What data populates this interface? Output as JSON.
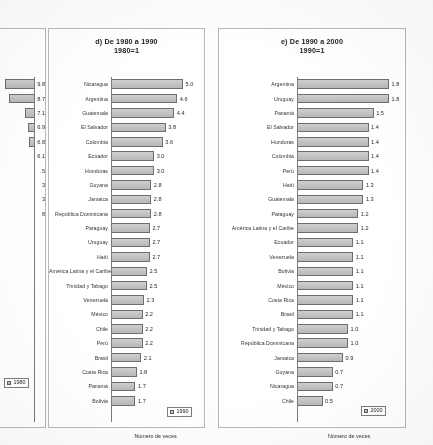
{
  "document": {
    "kind": "scanned-report-page",
    "axis_label": "Número de veces"
  },
  "panel_c": {
    "legend": "1980",
    "axis_fragment": "veces",
    "visible_values": [
      "9.8",
      "8.7",
      "7.1",
      "6.9",
      "6.8",
      "6.1",
      ".5",
      "3",
      "3",
      "8"
    ]
  },
  "panel_d": {
    "title": "d) De 1980 a 1990",
    "subtitle": "1980=1",
    "legend": "1990",
    "axis_label": "Número de veces"
  },
  "panel_e": {
    "title": "e) De 1990 a 2000",
    "subtitle": "1990=1",
    "legend": "2000",
    "axis_label": "Número de veces"
  },
  "chart_data": [
    {
      "id": "panel_d",
      "type": "bar",
      "orientation": "horizontal",
      "title": "d) De 1980 a 1990",
      "subtitle": "1980=1",
      "xlabel": "Número de veces",
      "ylabel": "",
      "xlim": [
        0,
        5.0
      ],
      "grid": false,
      "legend": "1990",
      "legend_position": "bottom-right",
      "categories": [
        "Nicaragua",
        "Argentina",
        "Guatemala",
        "El Salvador",
        "Colombia",
        "Ecuador",
        "Honduras",
        "Guyana",
        "Jamaica",
        "República Dominicana",
        "Paraguay",
        "Uruguay",
        "Haití",
        "América Latina y el Caribe",
        "Trinidad y Tabago",
        "Venezuela",
        "México",
        "Chile",
        "Perú",
        "Brasil",
        "Costa Rica",
        "Panamá",
        "Bolivia"
      ],
      "values": [
        5.0,
        4.6,
        4.4,
        3.8,
        3.6,
        3.0,
        3.0,
        2.8,
        2.8,
        2.8,
        2.7,
        2.7,
        2.7,
        2.5,
        2.5,
        2.3,
        2.2,
        2.2,
        2.2,
        2.1,
        1.8,
        1.7,
        1.7
      ],
      "value_labels": [
        "5.0",
        "4.6",
        "4.4",
        "3.8",
        "3.6",
        "3.0",
        "3.0",
        "2.8",
        "2.8",
        "2.8",
        "2.7",
        "2.7",
        "2.7",
        "2.5",
        "2.5",
        "2.3",
        "2.2",
        "2.2",
        "2.2",
        "2.1",
        "1.8",
        "1.7",
        "1.7"
      ]
    },
    {
      "id": "panel_e",
      "type": "bar",
      "orientation": "horizontal",
      "title": "e) De 1990 a 2000",
      "subtitle": "1990=1",
      "xlabel": "Número de veces",
      "ylabel": "",
      "xlim": [
        0,
        1.8
      ],
      "grid": false,
      "legend": "2000",
      "legend_position": "bottom-right",
      "categories": [
        "Argentina",
        "Uruguay",
        "Panamá",
        "El Salvador",
        "Honduras",
        "Colombia",
        "Perú",
        "Haití",
        "Guatemala",
        "Paraguay",
        "América Latina y el Caribe",
        "Ecuador",
        "Venezuela",
        "Bolivia",
        "México",
        "Costa Rica",
        "Brasil",
        "Trinidad y Tabago",
        "República Dominicana",
        "Jamaica",
        "Guyana",
        "Nicaragua",
        "Chile"
      ],
      "values": [
        1.8,
        1.8,
        1.5,
        1.4,
        1.4,
        1.4,
        1.4,
        1.3,
        1.3,
        1.2,
        1.2,
        1.1,
        1.1,
        1.1,
        1.1,
        1.1,
        1.1,
        1.0,
        1.0,
        0.9,
        0.7,
        0.7,
        0.5
      ],
      "value_labels": [
        "1.8",
        "1.8",
        "1.5",
        "1.4",
        "1.4",
        "1.4",
        "1.4",
        "1.3",
        "1.3",
        "1.2",
        "1.2",
        "1.1",
        "1.1",
        "1.1",
        "1.1",
        "1.1",
        "1.1",
        "1.0",
        "1.0",
        "0.9",
        "0.7",
        "0.7",
        "0.5"
      ]
    },
    {
      "id": "panel_c",
      "type": "bar",
      "orientation": "horizontal",
      "title": "",
      "subtitle": "",
      "xlabel": "veces",
      "legend": "1980",
      "note": "panel cropped at left page edge; only value labels visible",
      "categories": [],
      "values": [
        9.8,
        8.7,
        7.1,
        6.9,
        6.8,
        6.1,
        5.5,
        3,
        3,
        8
      ],
      "value_labels": [
        "9.8",
        "8.7",
        "7.1",
        "6.9",
        "6.8",
        "6.1",
        ".5",
        "3",
        "3",
        "8"
      ]
    }
  ]
}
